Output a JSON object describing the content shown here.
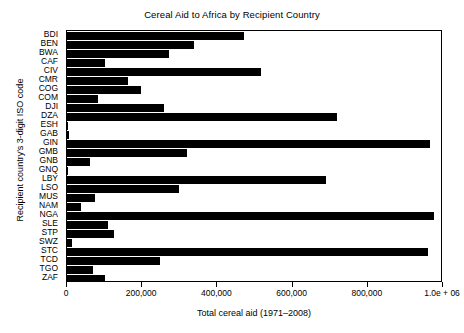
{
  "chart_data": {
    "type": "bar",
    "orientation": "horizontal",
    "title": "Cereal Aid to Africa by Recipient Country",
    "xlabel": "Total cereal aid (1971–2008)",
    "ylabel": "Recipient country's 3-digit ISO code",
    "xlim": [
      0,
      1000000
    ],
    "xticks": [
      0,
      200000,
      400000,
      600000,
      800000,
      1000000
    ],
    "xticklabels": [
      "0",
      "200,000",
      "400,000",
      "600,000",
      "800,000",
      "1.0e + 06"
    ],
    "grid": false,
    "legend": null,
    "bar_color": "#000000",
    "categories": [
      "BDI",
      "BEN",
      "BWA",
      "CAF",
      "CIV",
      "CMR",
      "COG",
      "COM",
      "DJI",
      "DZA",
      "ESH",
      "GAB",
      "GIN",
      "GMB",
      "GNB",
      "GNQ",
      "LBY",
      "LSO",
      "MUS",
      "NAM",
      "NGA",
      "SLE",
      "STP",
      "SWZ",
      "STC",
      "TCD",
      "TGO",
      "ZAF"
    ],
    "values": [
      472000,
      339000,
      272000,
      101000,
      515000,
      163000,
      197000,
      83000,
      258000,
      718000,
      3000,
      4000,
      966000,
      318000,
      60000,
      3000,
      689000,
      299000,
      75000,
      38000,
      976000,
      109000,
      124000,
      12000,
      960000,
      248000,
      70000,
      100000
    ]
  }
}
